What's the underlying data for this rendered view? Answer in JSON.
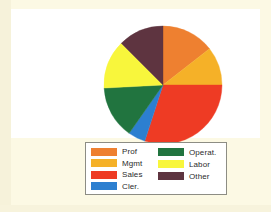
{
  "chart_data": {
    "type": "pie",
    "title": "",
    "subtitle": "",
    "xlabel": "",
    "ylabel": "",
    "grid": false,
    "legend_position": "bottom",
    "start_angle_deg": 0,
    "direction": "clockwise",
    "categories": [
      "Prof",
      "Mgmt",
      "Sales",
      "Cler.",
      "Operat.",
      "Labor",
      "Other"
    ],
    "values": [
      14.4,
      10.6,
      30.0,
      4.7,
      14.4,
      13.3,
      12.5
    ],
    "units": "percent",
    "angles_deg": [
      52,
      38,
      108,
      17,
      52,
      48,
      45
    ],
    "colors": [
      "#ee8030",
      "#f5b128",
      "#ee3b24",
      "#2c7fd0",
      "#21743f",
      "#f8f63c",
      "#5e3440"
    ],
    "slices": [
      {
        "label": "Prof",
        "value": 14.4,
        "angle_deg": 52,
        "color": "#ee8030"
      },
      {
        "label": "Mgmt",
        "value": 10.6,
        "angle_deg": 38,
        "color": "#f5b128"
      },
      {
        "label": "Sales",
        "value": 30.0,
        "angle_deg": 108,
        "color": "#ee3b24"
      },
      {
        "label": "Cler.",
        "value": 4.7,
        "angle_deg": 17,
        "color": "#2c7fd0"
      },
      {
        "label": "Operat.",
        "value": 14.4,
        "angle_deg": 52,
        "color": "#21743f"
      },
      {
        "label": "Labor",
        "value": 13.3,
        "angle_deg": 48,
        "color": "#f8f63c"
      },
      {
        "label": "Other",
        "value": 12.5,
        "angle_deg": 45,
        "color": "#5e3440"
      }
    ]
  },
  "legend": {
    "columns": [
      {
        "entries": [
          {
            "label": "Prof",
            "color": "#ee8030"
          },
          {
            "label": "Mgmt",
            "color": "#f5b128"
          },
          {
            "label": "Sales",
            "color": "#ee3b24"
          },
          {
            "label": "Cler.",
            "color": "#2c7fd0"
          }
        ]
      },
      {
        "entries": [
          {
            "label": "Operat.",
            "color": "#21743f"
          },
          {
            "label": "Labor",
            "color": "#f8f63c"
          },
          {
            "label": "Other",
            "color": "#5e3440"
          }
        ]
      }
    ]
  },
  "palette": {
    "page_background": "#fcf9e4",
    "panel_background": "#ffffff",
    "legend_border": "#8d8d84",
    "text": "#2b2b2b"
  }
}
